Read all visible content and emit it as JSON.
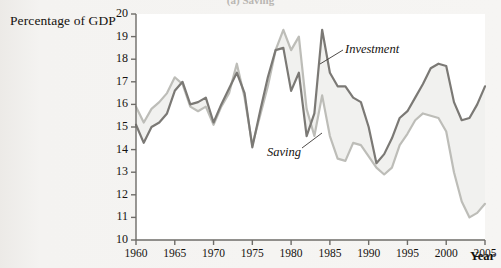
{
  "figure": {
    "partial_title": "(a) Saving",
    "y_axis_label": "Percentage of GDP",
    "x_axis_label": "Year"
  },
  "annotations": {
    "investment": "Investment",
    "saving": "Saving"
  },
  "colors": {
    "investment_line": "#7b7975",
    "saving_line": "#bdbdb8",
    "gap_fill": "#f1f1ef",
    "axis": "#6e6c68",
    "text": "#15120f",
    "plot_background": "#ffffff",
    "page_background": "#f4f3f1"
  },
  "chart_data": {
    "type": "line",
    "title": "(a) Saving",
    "xlabel": "Year",
    "ylabel": "Percentage of GDP",
    "xlim": [
      1960,
      2005
    ],
    "ylim": [
      10,
      20
    ],
    "xticks": [
      1960,
      1965,
      1970,
      1975,
      1980,
      1985,
      1990,
      1995,
      2000,
      2005
    ],
    "yticks": [
      10,
      11,
      12,
      13,
      14,
      15,
      16,
      17,
      18,
      19,
      20
    ],
    "grid": false,
    "legend": "inline-annotations",
    "x": [
      1960,
      1961,
      1962,
      1963,
      1964,
      1965,
      1966,
      1967,
      1968,
      1969,
      1970,
      1971,
      1972,
      1973,
      1974,
      1975,
      1976,
      1977,
      1978,
      1979,
      1980,
      1981,
      1982,
      1983,
      1984,
      1985,
      1986,
      1987,
      1988,
      1989,
      1990,
      1991,
      1992,
      1993,
      1994,
      1995,
      1996,
      1997,
      1998,
      1999,
      2000,
      2001,
      2002,
      2003,
      2004,
      2005
    ],
    "series": [
      {
        "name": "Investment",
        "color": "#7b7975",
        "values": [
          15.1,
          14.3,
          15.0,
          15.2,
          15.6,
          16.6,
          17.0,
          16.0,
          16.1,
          16.3,
          15.2,
          16.0,
          16.7,
          17.4,
          16.5,
          14.1,
          15.7,
          17.2,
          18.4,
          18.5,
          16.6,
          17.4,
          14.6,
          15.6,
          19.3,
          17.4,
          16.8,
          16.8,
          16.3,
          16.1,
          15.0,
          13.4,
          13.8,
          14.5,
          15.4,
          15.7,
          16.3,
          16.9,
          17.6,
          17.8,
          17.7,
          16.1,
          15.3,
          15.4,
          16.0,
          16.8
        ]
      },
      {
        "name": "Saving",
        "color": "#bdbdb8",
        "values": [
          15.9,
          15.2,
          15.8,
          16.1,
          16.5,
          17.2,
          16.9,
          15.9,
          15.7,
          15.9,
          15.1,
          15.9,
          16.5,
          17.8,
          16.3,
          14.2,
          15.5,
          16.8,
          18.4,
          19.3,
          18.4,
          19.0,
          15.8,
          14.6,
          16.4,
          14.6,
          13.6,
          13.5,
          14.3,
          14.2,
          13.7,
          13.2,
          12.9,
          13.2,
          14.2,
          14.7,
          15.3,
          15.6,
          15.5,
          15.4,
          14.8,
          13.0,
          11.7,
          11.0,
          11.2,
          11.6
        ]
      }
    ]
  }
}
